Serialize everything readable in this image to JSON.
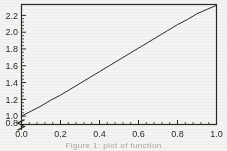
{
  "figure": {
    "background_color": "#f4f3f1",
    "ink_color": "#2b2927",
    "frame_color": "#2b2927"
  },
  "caption": {
    "text": "Figure 1: plot of function"
  },
  "chart_data": {
    "type": "line",
    "title": "",
    "subtitle": "",
    "xlabel": "",
    "ylabel": "",
    "xlim": [
      0.0,
      1.0
    ],
    "ylim": [
      0.9,
      2.33
    ],
    "y_axis_break": true,
    "y_axis_break_label": "0.8",
    "grid": false,
    "legend": null,
    "legend_position": "none",
    "xticks": [
      0.0,
      0.2,
      0.4,
      0.6,
      0.8,
      1.0
    ],
    "xticklabels": [
      "0.0",
      "0.2",
      "0.4",
      "0.6",
      "0.8",
      "1.0"
    ],
    "x_minor_tick_count": 4,
    "yticks": [
      1.0,
      1.2,
      1.4,
      1.6,
      1.8,
      2.0,
      2.2
    ],
    "yticklabels": [
      "1.0",
      "1.2",
      "1.4",
      "1.6",
      "1.8",
      "2.0",
      "2.2"
    ],
    "y_minor_tick_count": 4,
    "series": [
      {
        "name": "curve",
        "color": "#2b2927",
        "linewidth": 1,
        "x": [
          0.0,
          0.05,
          0.1,
          0.15,
          0.2,
          0.25,
          0.3,
          0.35,
          0.4,
          0.45,
          0.5,
          0.55,
          0.6,
          0.65,
          0.7,
          0.75,
          0.8,
          0.85,
          0.9,
          0.95,
          1.0
        ],
        "y": [
          1.0,
          1.06,
          1.12,
          1.19,
          1.25,
          1.32,
          1.39,
          1.46,
          1.53,
          1.6,
          1.67,
          1.74,
          1.81,
          1.88,
          1.95,
          2.02,
          2.09,
          2.15,
          2.22,
          2.27,
          2.32
        ]
      }
    ]
  }
}
